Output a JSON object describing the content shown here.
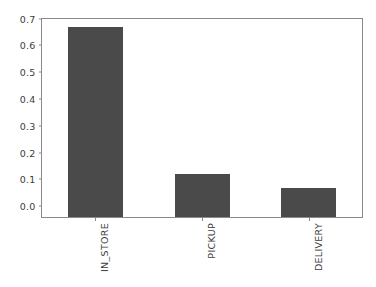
{
  "chart_data": {
    "type": "bar",
    "title": "",
    "xlabel": "",
    "ylabel": "",
    "categories": [
      "IN_STORE",
      "PICKUP",
      "DELIVERY"
    ],
    "values": [
      0.712,
      0.162,
      0.107
    ],
    "ylim": [
      0.0,
      0.74
    ],
    "yticks": [
      "0.0",
      "0.1",
      "0.2",
      "0.3",
      "0.4",
      "0.5",
      "0.6",
      "0.7"
    ],
    "ytick_values": [
      0.0,
      0.1,
      0.2,
      0.3,
      0.4,
      0.5,
      0.6,
      0.7
    ],
    "grid": false,
    "legend": null,
    "bar_color": "#4a4a4a",
    "axis_color": "#8a8a8a",
    "background": "#ffffff",
    "xtick_rotation": 90
  }
}
